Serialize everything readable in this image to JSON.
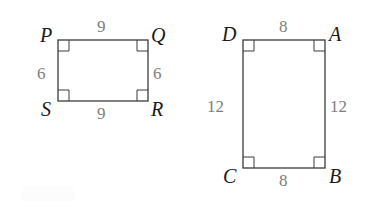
{
  "figure": {
    "stroke_color": "#3b3b3b",
    "label_color": "#1a1a1a",
    "measure_color": "#7d7d7d",
    "background_color": "#ffffff",
    "shapes": [
      {
        "name": "rectangle-pqrs",
        "vertices": [
          {
            "key": "P",
            "label": "P",
            "position": "top-left"
          },
          {
            "key": "Q",
            "label": "Q",
            "position": "top-right"
          },
          {
            "key": "R",
            "label": "R",
            "position": "bottom-right"
          },
          {
            "key": "S",
            "label": "S",
            "position": "bottom-left"
          }
        ],
        "sides": [
          {
            "name": "top",
            "label": "9"
          },
          {
            "name": "right",
            "label": "6"
          },
          {
            "name": "bottom",
            "label": "9"
          },
          {
            "name": "left",
            "label": "6"
          }
        ],
        "right_angle_marks": 4
      },
      {
        "name": "rectangle-dabc",
        "vertices": [
          {
            "key": "D",
            "label": "D",
            "position": "top-left"
          },
          {
            "key": "A",
            "label": "A",
            "position": "top-right"
          },
          {
            "key": "B",
            "label": "B",
            "position": "bottom-right"
          },
          {
            "key": "C",
            "label": "C",
            "position": "bottom-left"
          }
        ],
        "sides": [
          {
            "name": "top",
            "label": "8"
          },
          {
            "name": "right",
            "label": "12"
          },
          {
            "name": "bottom",
            "label": "8"
          },
          {
            "name": "left",
            "label": "12"
          }
        ],
        "right_angle_marks": 4
      }
    ]
  }
}
